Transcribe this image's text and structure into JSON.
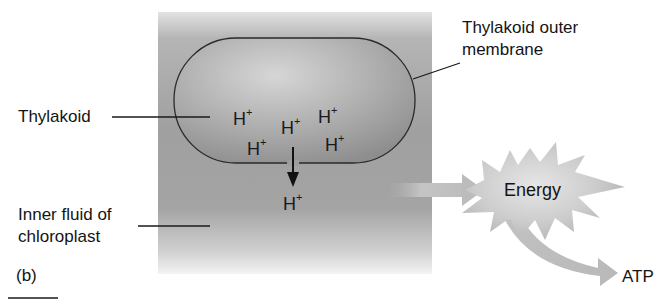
{
  "figure": {
    "panel_label": "(b)",
    "labels": {
      "thylakoid": "Thylakoid",
      "thylakoid_outer_membrane_line1": "Thylakoid outer",
      "thylakoid_outer_membrane_line2": "membrane",
      "inner_fluid_line1": "Inner fluid of",
      "inner_fluid_line2": "chloroplast",
      "energy": "Energy",
      "atp": "ATP"
    },
    "ions": [
      {
        "symbol": "H",
        "charge": "+",
        "location": "inside thylakoid"
      },
      {
        "symbol": "H",
        "charge": "+",
        "location": "inside thylakoid"
      },
      {
        "symbol": "H",
        "charge": "+",
        "location": "inside thylakoid"
      },
      {
        "symbol": "H",
        "charge": "+",
        "location": "inside thylakoid"
      },
      {
        "symbol": "H",
        "charge": "+",
        "location": "inside thylakoid"
      },
      {
        "symbol": "H",
        "charge": "+",
        "location": "inner fluid (after crossing membrane)"
      }
    ],
    "colors": {
      "stroma_gray": "#9a9a9a",
      "thylakoid_fill": "#a8a8a8",
      "membrane_stroke": "#2a2a2a",
      "energy_burst": "#c8c8c8",
      "arrow_gray": "#bdbdbd"
    }
  }
}
